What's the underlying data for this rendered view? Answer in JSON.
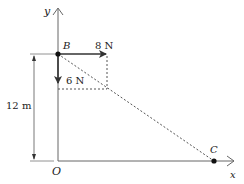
{
  "diagram": {
    "axes": {
      "x_label": "x",
      "y_label": "y",
      "origin_label": "O"
    },
    "points": [
      {
        "name": "B",
        "label": "B"
      },
      {
        "name": "C",
        "label": "C"
      }
    ],
    "forces": [
      {
        "label": "8 N",
        "direction": "right"
      },
      {
        "label": "6 N",
        "direction": "down"
      }
    ],
    "dimension": {
      "label": "12 m"
    },
    "colors": {
      "line": "#333333",
      "dashed": "#555555",
      "dot": "#111111"
    }
  }
}
